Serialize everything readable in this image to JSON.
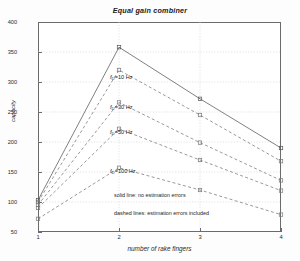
{
  "chart_data": {
    "type": "line",
    "title": "Equal gain combiner",
    "xlabel": "number of rake fingers",
    "ylabel": "capacity",
    "x": [
      1,
      2,
      3,
      4
    ],
    "xlim": [
      1,
      4
    ],
    "ylim": [
      50,
      400
    ],
    "xticks": [
      "1",
      "2",
      "3",
      "4"
    ],
    "yticks": [
      "400",
      "350",
      "300",
      "250",
      "200",
      "150",
      "100",
      "50"
    ],
    "grid": true,
    "legend_position": "inside-center",
    "series": [
      {
        "name": "no estimation errors",
        "style": "solid",
        "marker": "square",
        "color": "#555555",
        "values": [
          103,
          358,
          272,
          190
        ]
      },
      {
        "name": "f_D=10 Hz",
        "style": "dashed",
        "marker": "square",
        "color": "#777777",
        "values": [
          100,
          320,
          245,
          168
        ]
      },
      {
        "name": "f_D=30 Hz",
        "style": "dashed",
        "marker": "square",
        "color": "#777777",
        "values": [
          95,
          266,
          199,
          136
        ]
      },
      {
        "name": "f_D=50 Hz",
        "style": "dashed",
        "marker": "square",
        "color": "#777777",
        "values": [
          90,
          222,
          170,
          119
        ]
      },
      {
        "name": "f_D=100 Hz",
        "style": "dashed",
        "marker": "square",
        "color": "#777777",
        "values": [
          72,
          157,
          120,
          79
        ]
      }
    ],
    "annotations": [
      {
        "text": "f",
        "sub": "D",
        "suffix": "=10 Hz"
      },
      {
        "text": "f",
        "sub": "D",
        "suffix": "=30 Hz"
      },
      {
        "text": "f",
        "sub": "D",
        "suffix": "=50 Hz"
      },
      {
        "text": "f",
        "sub": "D",
        "suffix": "=100 Hz"
      }
    ],
    "legend_lines": [
      "solid line: no estimation errors",
      "dashed lines: estimation errors included"
    ]
  }
}
